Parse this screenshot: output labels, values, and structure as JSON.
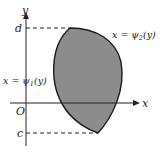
{
  "diagram": {
    "axes": {
      "x_label": "x",
      "y_label": "y",
      "origin_label": "O"
    },
    "bounds": {
      "upper_label": "d",
      "lower_label": "c"
    },
    "curves": {
      "left": {
        "prefix": "x = ψ",
        "sub": "1",
        "suffix": "(y)"
      },
      "right": {
        "prefix": "x = ψ",
        "sub": "2",
        "suffix": "(y)"
      }
    },
    "colors": {
      "region_fill": "#8c8c8c",
      "stroke": "#1a1a1a"
    }
  }
}
